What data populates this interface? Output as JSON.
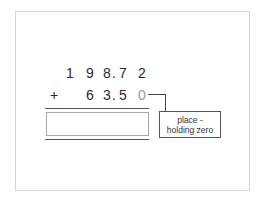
{
  "problem": {
    "operation": "addition",
    "row1": {
      "digits": [
        "1",
        "9",
        "8",
        ".",
        "7",
        "2"
      ],
      "value": "198.72"
    },
    "row2": {
      "operator": "+",
      "digits": [
        "6",
        "3",
        ".",
        "5",
        "0"
      ],
      "value": "63.50",
      "placeholder_zero": "0"
    },
    "answer": ""
  },
  "annotation": {
    "line1": "place -",
    "line2": "holding zero"
  },
  "colors": {
    "digits": "#2a2a2a",
    "placeholder_zero": "#9a9a9a",
    "frame": "#d6d6d6",
    "rules": "#555555"
  }
}
